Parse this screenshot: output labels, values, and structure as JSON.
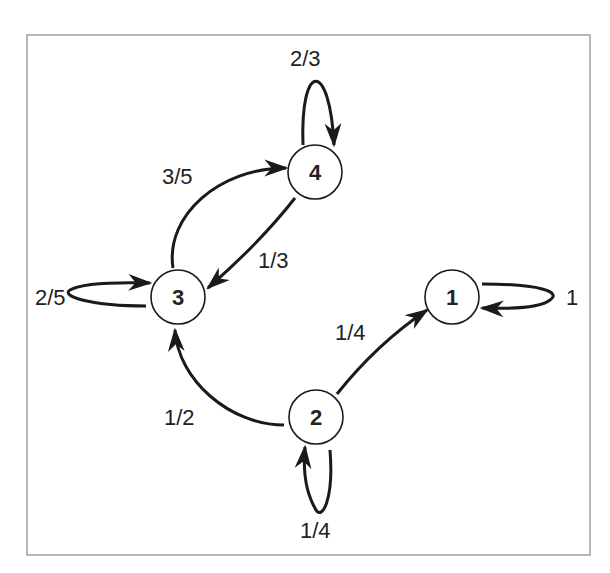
{
  "diagram": {
    "type": "markov-chain-state-diagram",
    "nodes": [
      {
        "id": "1",
        "label": "1"
      },
      {
        "id": "2",
        "label": "2"
      },
      {
        "id": "3",
        "label": "3"
      },
      {
        "id": "4",
        "label": "4"
      }
    ],
    "edges": [
      {
        "from": "4",
        "to": "4",
        "label": "2/3"
      },
      {
        "from": "3",
        "to": "4",
        "label": "3/5"
      },
      {
        "from": "4",
        "to": "3",
        "label": "1/3"
      },
      {
        "from": "3",
        "to": "3",
        "label": "2/5"
      },
      {
        "from": "1",
        "to": "1",
        "label": "1"
      },
      {
        "from": "2",
        "to": "1",
        "label": "1/4"
      },
      {
        "from": "2",
        "to": "3",
        "label": "1/2"
      },
      {
        "from": "2",
        "to": "2",
        "label": "1/4"
      }
    ]
  },
  "colors": {
    "stroke": "#1a1a1a",
    "frame": "#888888",
    "background": "#ffffff"
  }
}
